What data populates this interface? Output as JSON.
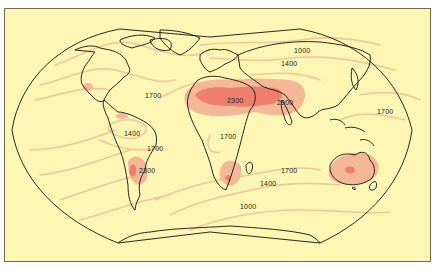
{
  "figure": {
    "type": "world contour map",
    "projection": "Winkel-Tripel-like world map"
  },
  "colors": {
    "background": "#fdf6b4",
    "frame": "#6b6b55",
    "contour_line": "#f0c89a",
    "shade_low": "#f4b898",
    "shade_high": "#ee7f6e",
    "coastline": "#111111"
  },
  "labels": [
    {
      "id": "label-1000-north",
      "text": "1000",
      "x": 294,
      "y": 50
    },
    {
      "id": "label-1400-north",
      "text": "1400",
      "x": 281,
      "y": 63
    },
    {
      "id": "label-1700-atlantic",
      "text": "1700",
      "x": 145,
      "y": 95
    },
    {
      "id": "label-2300-sahara",
      "text": "2300",
      "x": 227,
      "y": 100
    },
    {
      "id": "label-2000-arabia",
      "text": "2000",
      "x": 277,
      "y": 102
    },
    {
      "id": "label-1700-pacific",
      "text": "1700",
      "x": 377,
      "y": 111
    },
    {
      "id": "label-1400-amazon",
      "text": "1400",
      "x": 124,
      "y": 133
    },
    {
      "id": "label-1700-brazil",
      "text": "1700",
      "x": 147,
      "y": 148
    },
    {
      "id": "label-1700-africa",
      "text": "1700",
      "x": 220,
      "y": 136
    },
    {
      "id": "label-2300-chaco",
      "text": "2300",
      "x": 139,
      "y": 170
    },
    {
      "id": "label-1700-indian",
      "text": "1700",
      "x": 281,
      "y": 170
    },
    {
      "id": "label-1400-indian",
      "text": "1400",
      "x": 260,
      "y": 183
    },
    {
      "id": "label-1000-southern",
      "text": "1000",
      "x": 240,
      "y": 206
    }
  ],
  "shaded_regions": [
    {
      "name": "sahara-arabia-high",
      "level": 2300
    },
    {
      "name": "kalahari-high",
      "level": 2300
    },
    {
      "name": "chaco-high",
      "level": 2300
    },
    {
      "name": "australia-high",
      "level": 2300
    },
    {
      "name": "mexico-high",
      "level": 2000
    }
  ]
}
